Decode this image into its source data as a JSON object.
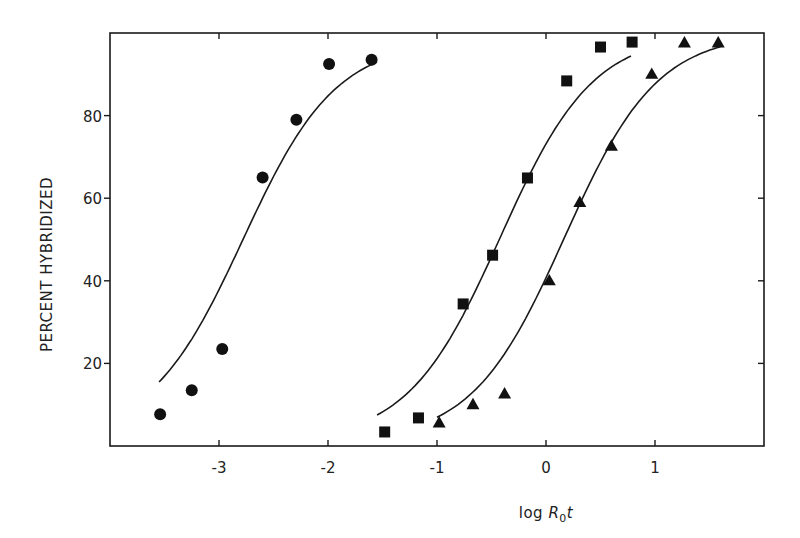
{
  "chart_data": {
    "type": "scatter",
    "title": "",
    "xlabel": "log R0t",
    "xlabel_parts": {
      "prefix": "log ",
      "var": "R",
      "sub": "0",
      "suffix": "t"
    },
    "ylabel": "PERCENT HYBRIDIZED",
    "xlim": [
      -4,
      2
    ],
    "ylim": [
      0,
      100
    ],
    "x_ticks": [
      -3,
      -2,
      -1,
      0,
      1
    ],
    "x_tick_labels": [
      "-3",
      "-2",
      "-1",
      "0",
      "1"
    ],
    "y_ticks": [
      20,
      40,
      60,
      80
    ],
    "y_tick_labels": [
      "20",
      "40",
      "60",
      "80"
    ],
    "grid": false,
    "legend": null,
    "series": [
      {
        "name": "circles",
        "marker": "circle",
        "x": [
          -3.54,
          -3.25,
          -2.97,
          -2.6,
          -2.29,
          -1.99,
          -1.6
        ],
        "y": [
          7.7,
          13.5,
          23.5,
          65,
          79,
          92.5,
          93.5
        ],
        "fit_curve": {
          "x_range": [
            -3.55,
            -1.55
          ],
          "midpoint": -2.78,
          "slope": 2.35,
          "low": 2,
          "high": 98
        }
      },
      {
        "name": "squares",
        "marker": "square",
        "x": [
          -1.48,
          -1.17,
          -0.76,
          -0.49,
          -0.17,
          0.19,
          0.5,
          0.79
        ],
        "y": [
          3.4,
          6.8,
          34.4,
          46.2,
          64.9,
          88.4,
          96.6,
          97.8
        ],
        "fit_curve": {
          "x_range": [
            -1.55,
            0.78
          ],
          "midpoint": -0.42,
          "slope": 2.35,
          "low": 1,
          "high": 100
        }
      },
      {
        "name": "triangles",
        "marker": "triangle",
        "x": [
          -0.98,
          -0.67,
          -0.38,
          0.03,
          0.31,
          0.6,
          0.97,
          1.27,
          1.58
        ],
        "y": [
          5.6,
          10,
          12.6,
          40,
          59,
          72.6,
          90,
          97.6,
          97.6
        ],
        "fit_curve": {
          "x_range": [
            -1.0,
            1.6
          ],
          "midpoint": 0.17,
          "slope": 2.35,
          "low": 1,
          "high": 100
        }
      }
    ]
  },
  "layout": {
    "frame": {
      "left": 110,
      "right": 764,
      "top": 33,
      "bottom": 446
    },
    "marker_size": 6
  }
}
